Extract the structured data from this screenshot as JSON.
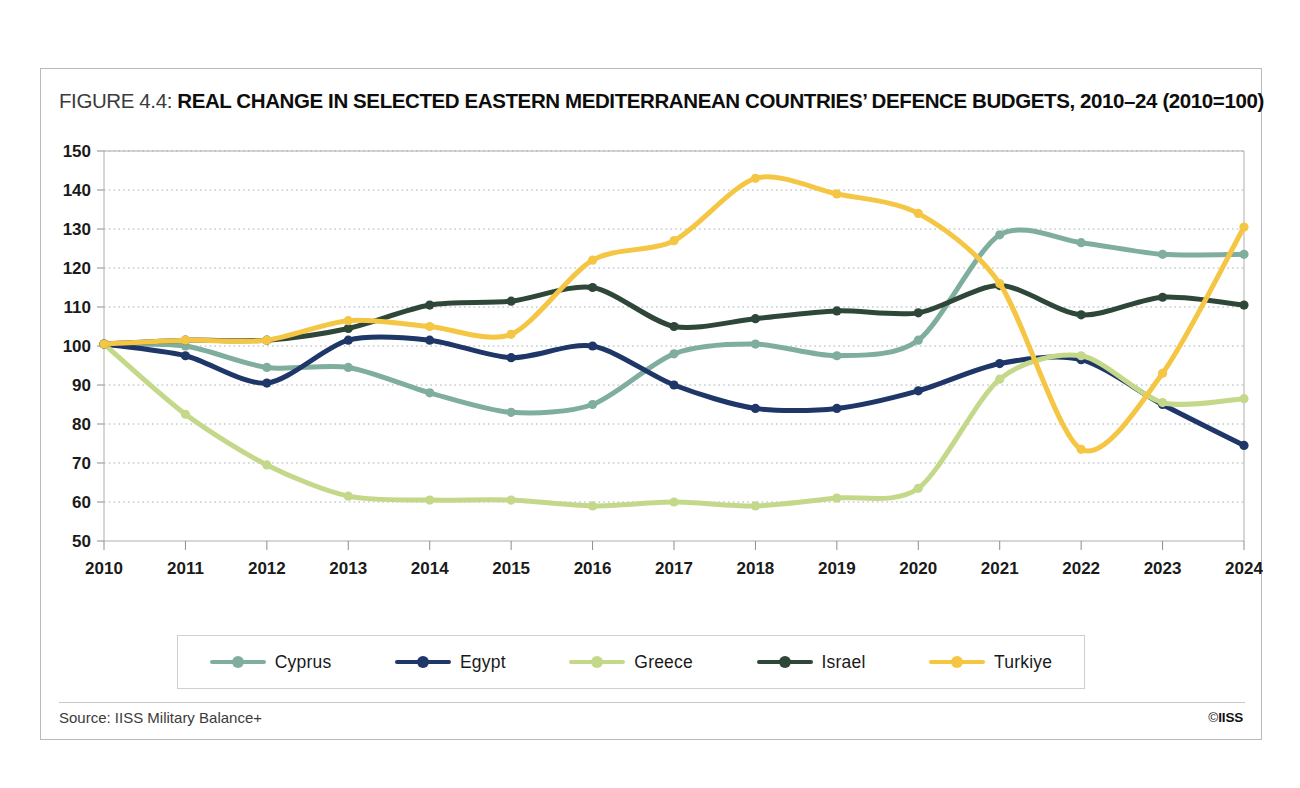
{
  "figure": {
    "label": "FIGURE 4.4:",
    "title": "REAL CHANGE IN SELECTED EASTERN MEDITERRANEAN COUNTRIES’ DEFENCE BUDGETS, 2010–24 (2010=100)",
    "source": "Source: IISS Military Balance+",
    "copyright_symbol": "©",
    "copyright_text": "IISS"
  },
  "chart_data": {
    "type": "line",
    "title": "REAL CHANGE IN SELECTED EASTERN MEDITERRANEAN COUNTRIES’ DEFENCE BUDGETS, 2010–24 (2010=100)",
    "xlabel": "",
    "ylabel": "",
    "x": [
      2010,
      2011,
      2012,
      2013,
      2014,
      2015,
      2016,
      2017,
      2018,
      2019,
      2020,
      2021,
      2022,
      2023,
      2024
    ],
    "categories": [
      "2010",
      "2011",
      "2012",
      "2013",
      "2014",
      "2015",
      "2016",
      "2017",
      "2018",
      "2019",
      "2020",
      "2021",
      "2022",
      "2023",
      "2024"
    ],
    "xlim": [
      2010,
      2024
    ],
    "ylim": [
      50,
      150
    ],
    "yticks": [
      50,
      60,
      70,
      80,
      90,
      100,
      110,
      120,
      130,
      140,
      150
    ],
    "ytick_labels": [
      "50",
      "60",
      "70",
      "80",
      "90",
      "100",
      "110",
      "120",
      "130",
      "140",
      "150"
    ],
    "grid": true,
    "grid_style": "dotted-horizontal",
    "legend_position": "bottom",
    "series": [
      {
        "name": "Cyprus",
        "color": "#7fae9f",
        "values": [
          100.5,
          100.0,
          94.5,
          94.5,
          88.0,
          83.0,
          85.0,
          98.0,
          100.5,
          97.5,
          101.5,
          128.5,
          126.5,
          123.5,
          123.5
        ]
      },
      {
        "name": "Egypt",
        "color": "#1f3668",
        "values": [
          100.5,
          97.5,
          90.5,
          101.5,
          101.5,
          97.0,
          100.0,
          90.0,
          84.0,
          84.0,
          88.5,
          95.5,
          96.5,
          85.0,
          74.5
        ]
      },
      {
        "name": "Greece",
        "color": "#c4d88a",
        "values": [
          100.5,
          82.5,
          69.5,
          61.5,
          60.5,
          60.5,
          59.0,
          60.0,
          59.0,
          61.0,
          63.5,
          91.5,
          97.5,
          85.5,
          86.5
        ]
      },
      {
        "name": "Israel",
        "color": "#2f4738",
        "values": [
          100.5,
          101.5,
          101.5,
          104.5,
          110.5,
          111.5,
          115.0,
          105.0,
          107.0,
          109.0,
          108.5,
          115.5,
          108.0,
          112.5,
          110.5
        ]
      },
      {
        "name": "Turkiye",
        "color": "#f4c košt"
      }
    ]
  },
  "legend": {
    "items": [
      {
        "label": "Cyprus",
        "color": "#7fae9f"
      },
      {
        "label": "Egypt",
        "color": "#1f3668"
      },
      {
        "label": "Greece",
        "color": "#c4d88a"
      },
      {
        "label": "Israel",
        "color": "#2f4738"
      },
      {
        "label": "Turkiye",
        "color": "#f5c544"
      }
    ]
  }
}
